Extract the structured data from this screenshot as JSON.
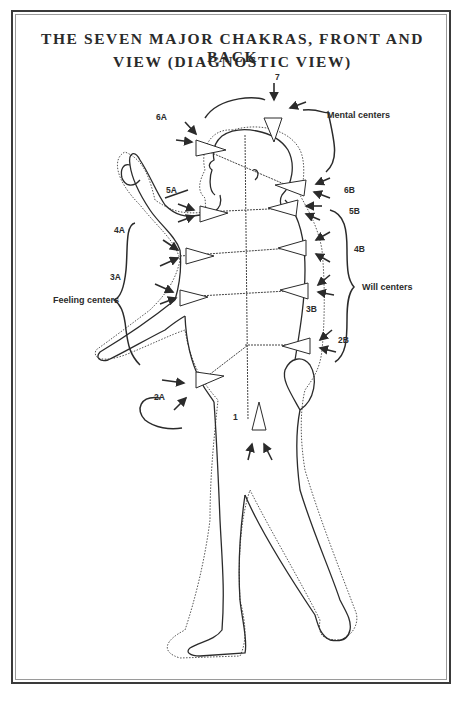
{
  "title": {
    "line1": "THE SEVEN MAJOR CHAKRAS, FRONT AND BACK",
    "line2": "VIEW (DIAGNOSTIC VIEW)"
  },
  "colors": {
    "ink": "#2b2b2b",
    "frame": "#3a3a3a",
    "frame_inner": "#9a9a9a",
    "background": "#ffffff"
  },
  "chakra_labels": {
    "c7": "7",
    "c6a": "6A",
    "c6b": "6B",
    "c5a": "5A",
    "c5b": "5B",
    "c4a": "4A",
    "c4b": "4B",
    "c3a": "3A",
    "c3b": "3B",
    "c2a": "2A",
    "c2b": "2B",
    "c1": "1"
  },
  "group_labels": {
    "mental": "Mental centers",
    "feeling": "Feeling centers",
    "will": "Will centers"
  }
}
